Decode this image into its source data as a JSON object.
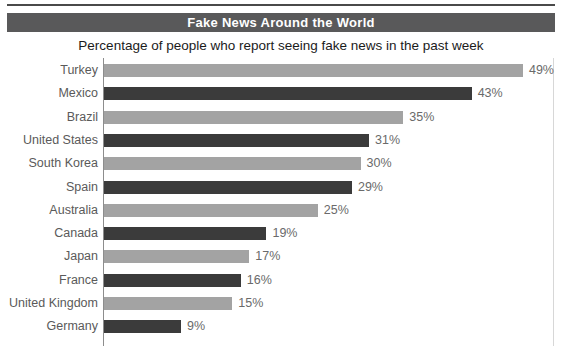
{
  "header": {
    "banner_title": "Fake News Around the World",
    "subtitle": "Percentage of people who report seeing fake news in the past week"
  },
  "colors": {
    "banner_background": "#59595a",
    "banner_text": "#ffffff",
    "bar_light": "#a3a3a3",
    "bar_dark": "#3b3b3b",
    "axis_line": "#8d8d8d",
    "label_text": "#5a5a5a"
  },
  "chart_data": {
    "type": "bar",
    "orientation": "horizontal",
    "title": "Fake News Around the World",
    "subtitle": "Percentage of people who report seeing fake news in the past week",
    "xlabel": "",
    "ylabel": "",
    "xlim": [
      0,
      53
    ],
    "grid": false,
    "legend": null,
    "value_suffix": "%",
    "categories": [
      "Turkey",
      "Mexico",
      "Brazil",
      "United States",
      "South Korea",
      "Spain",
      "Australia",
      "Canada",
      "Japan",
      "France",
      "United Kingdom",
      "Germany"
    ],
    "values": [
      49,
      43,
      35,
      31,
      30,
      29,
      25,
      19,
      17,
      16,
      15,
      9
    ],
    "value_labels": [
      "49%",
      "43%",
      "35%",
      "31%",
      "30%",
      "29%",
      "25%",
      "19%",
      "17%",
      "16%",
      "15%",
      "9%"
    ],
    "bar_colors": [
      "light",
      "dark",
      "light",
      "dark",
      "light",
      "dark",
      "light",
      "dark",
      "light",
      "dark",
      "light",
      "dark"
    ]
  }
}
